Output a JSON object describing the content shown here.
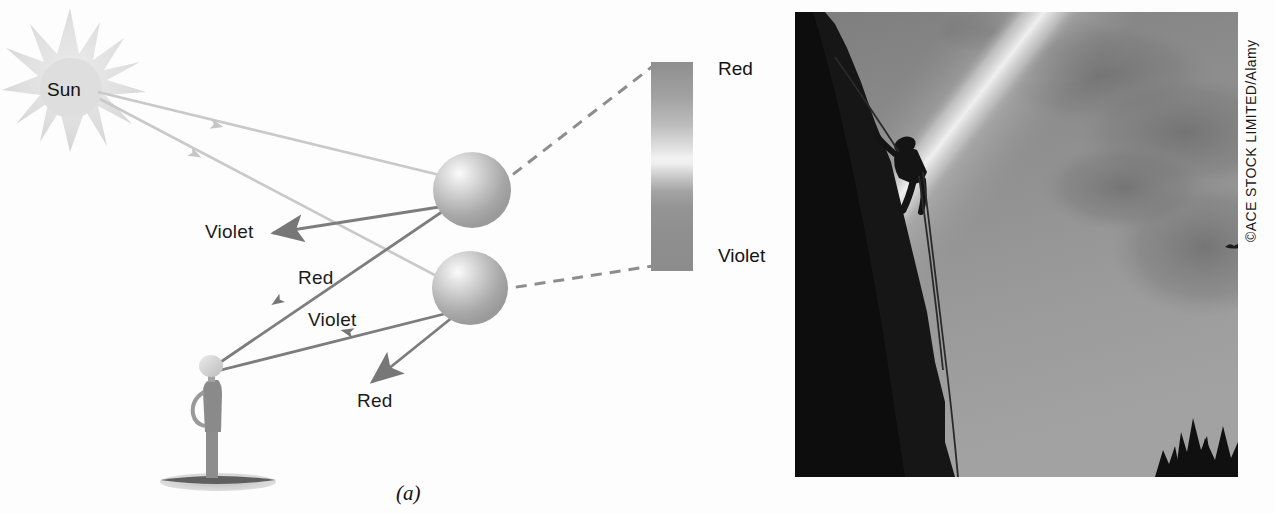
{
  "figure": {
    "panels": [
      {
        "id": "a",
        "caption": "(a)",
        "kind": "ray-diagram"
      },
      {
        "id": "b",
        "caption": "(b)",
        "kind": "photograph"
      }
    ]
  },
  "panel_a": {
    "sun_label": "Sun",
    "ray_labels": {
      "upper_violet": "Violet",
      "middle_red": "Red",
      "middle_violet": "Violet",
      "lower_red": "Red"
    },
    "spectrum": {
      "top_label": "Red",
      "bottom_label": "Violet"
    },
    "observer": "person-silhouette",
    "droplets": [
      {
        "name": "upper-water-drop"
      },
      {
        "name": "lower-water-drop"
      }
    ]
  },
  "panel_b": {
    "credit": "©ACE STOCK LIMITED/Alamy",
    "subject": "rock climber on cliff with rainbow"
  },
  "colors": {
    "sunray": "#c9c9c9",
    "colored_ray": "#7b7b7b",
    "dashed_line": "#8b8b8b",
    "drop_fill": "#b9b9b9",
    "person": "#8d8d8d",
    "ground": "#6b6b6b",
    "text": "#151515",
    "spectrum_red_end": "#8f8f8f",
    "spectrum_mid": "#f2f2f2",
    "spectrum_violet_end": "#8c8c8c"
  }
}
